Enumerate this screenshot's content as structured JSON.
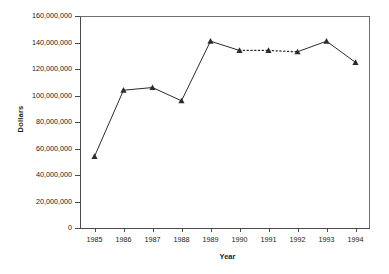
{
  "chart_data": {
    "type": "line",
    "title": "",
    "xlabel": "Year",
    "ylabel": "Dollars",
    "categories": [
      1985,
      1986,
      1987,
      1988,
      1989,
      1990,
      1991,
      1992,
      1993,
      1994
    ],
    "x_tick_labels": [
      "1985",
      "1986",
      "1987",
      "1988",
      "1989",
      "1990",
      "1991",
      "1992",
      "1993",
      "1994"
    ],
    "values": [
      54000000,
      104000000,
      106000000,
      96000000,
      141000000,
      134000000,
      134000000,
      133000000,
      141000000,
      125000000
    ],
    "series": [
      {
        "name": "Dollars",
        "values": [
          54000000,
          104000000,
          106000000,
          96000000,
          141000000,
          134000000,
          134000000,
          133000000,
          141000000,
          125000000
        ],
        "marker": "triangle",
        "color": "#2b2b2b",
        "dashed_segments": [
          [
            1990,
            1991
          ],
          [
            1991,
            1992
          ]
        ]
      }
    ],
    "ylim": [
      0,
      160000000
    ],
    "y_ticks": [
      0,
      20000000,
      40000000,
      60000000,
      80000000,
      100000000,
      120000000,
      140000000,
      160000000
    ],
    "y_tick_labels": [
      "0",
      "20,000,000",
      "40,000,000",
      "60,000,000",
      "80,000,000",
      "100,000,000",
      "120,000,000",
      "140,000,000",
      "160,000,000"
    ],
    "grid": false,
    "legend": "none",
    "line_color": "#2b2b2b",
    "axis_color": "#4a4a4a",
    "background": "#ffffff"
  },
  "caption": {
    "clipped_text": ""
  }
}
